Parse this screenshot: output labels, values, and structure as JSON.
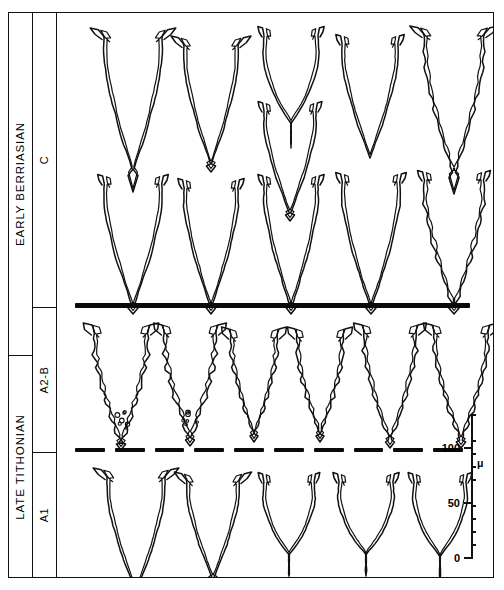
{
  "plate": {
    "title": "Calpionellid test outline drawings biostratigraphic plate",
    "background": "#ffffff",
    "ink": "#111111"
  },
  "stages": [
    {
      "id": "early-berriasian",
      "label": "EARLY BERRIASIAN",
      "top": 12,
      "height": 343
    },
    {
      "id": "late-tithonian",
      "label": "LATE TITHONIAN",
      "top": 355,
      "height": 223
    }
  ],
  "zones": [
    {
      "id": "c",
      "label": "C",
      "top": 12,
      "height": 295
    },
    {
      "id": "a2-b",
      "label": "A2-B",
      "top": 307,
      "height": 145
    },
    {
      "id": "a1",
      "label": "A1",
      "top": 452,
      "height": 126
    }
  ],
  "boundaries": [
    {
      "id": "solid-boundary",
      "style": "solid",
      "x": 75,
      "y": 303,
      "width": 395,
      "note": "Tithonian-Berriasian boundary"
    },
    {
      "id": "dashed-boundary",
      "style": "dashed",
      "x": 75,
      "y": 448,
      "width": 388,
      "dashes": 10,
      "note": "A1 / A2-B subzone boundary"
    }
  ],
  "scale": {
    "id": "micron-scale",
    "unit_label": "μ",
    "axis_x": 471,
    "axis_top": 415,
    "axis_bottom": 558,
    "min": 0,
    "max": 110,
    "minor_step": 10,
    "major_ticks": [
      {
        "value": 100,
        "label": "100",
        "y": 448
      },
      {
        "value": 50,
        "label": "50",
        "y": 503
      },
      {
        "value": 0,
        "label": "0",
        "y": 558
      }
    ],
    "minor_ticks": [
      110,
      90,
      80,
      70,
      60,
      40,
      30,
      20,
      10
    ]
  },
  "rows": [
    {
      "id": "row-c-upper",
      "zone": "C",
      "specimen_count": 5,
      "specimens": [
        {
          "id": "c-u-1",
          "cx": 45,
          "cy": 22,
          "w": 62,
          "h": 132,
          "shape": "flared-collar-pointed",
          "ornament": "smooth",
          "tail": "long-spine"
        },
        {
          "id": "c-u-2",
          "cx": 125,
          "cy": 30,
          "w": 58,
          "h": 118,
          "shape": "flared-collar-pointed",
          "ornament": "smooth",
          "tail": "short-spine"
        },
        {
          "id": "c-u-3",
          "cx": 205,
          "cy": 20,
          "w": 58,
          "h": 110,
          "shape": "collar-rounded",
          "ornament": "smooth",
          "tail": "none"
        },
        {
          "id": "c-u-4",
          "cx": 283,
          "cy": 28,
          "w": 60,
          "h": 112,
          "shape": "collar-pointed",
          "ornament": "smooth",
          "tail": "none"
        },
        {
          "id": "c-u-5",
          "cx": 365,
          "cy": 20,
          "w": 64,
          "h": 136,
          "shape": "flared-collar-pointed",
          "ornament": "crenulate",
          "tail": "long-spine"
        }
      ]
    },
    {
      "id": "row-c-mid",
      "zone": "C",
      "specimen_count": 1,
      "specimens": [
        {
          "id": "c-m-1",
          "cx": 205,
          "cy": 95,
          "w": 56,
          "h": 102,
          "shape": "collar-pointed",
          "ornament": "smooth",
          "tail": "short-spine"
        }
      ]
    },
    {
      "id": "row-c-lower",
      "zone": "C",
      "specimen_count": 5,
      "specimens": [
        {
          "id": "c-l-1",
          "cx": 45,
          "cy": 168,
          "w": 62,
          "h": 122,
          "shape": "tube-pointed",
          "ornament": "smooth",
          "tail": "short-spine"
        },
        {
          "id": "c-l-2",
          "cx": 125,
          "cy": 172,
          "w": 58,
          "h": 118,
          "shape": "tube-pointed",
          "ornament": "smooth",
          "tail": "short-spine"
        },
        {
          "id": "c-l-3",
          "cx": 205,
          "cy": 168,
          "w": 58,
          "h": 122,
          "shape": "tube-pointed",
          "ornament": "smooth",
          "tail": "short-spine"
        },
        {
          "id": "c-l-4",
          "cx": 283,
          "cy": 166,
          "w": 62,
          "h": 124,
          "shape": "tube-pointed",
          "ornament": "smooth",
          "tail": "short-spine"
        },
        {
          "id": "c-l-5",
          "cx": 365,
          "cy": 164,
          "w": 64,
          "h": 126,
          "shape": "tube-pointed",
          "ornament": "crenulate",
          "tail": "short-spine"
        }
      ]
    },
    {
      "id": "row-a2b",
      "zone": "A2-B",
      "specimen_count": 6,
      "specimens": [
        {
          "id": "a2b-1",
          "cx": 35,
          "cy": 318,
          "w": 58,
          "h": 108,
          "shape": "hook-collar-pointed",
          "ornament": "crenulate-granular",
          "tail": "short-spine"
        },
        {
          "id": "a2b-2",
          "cx": 105,
          "cy": 318,
          "w": 56,
          "h": 104,
          "shape": "hook-collar-pointed",
          "ornament": "crenulate-granular",
          "tail": "short-spine"
        },
        {
          "id": "a2b-3",
          "cx": 172,
          "cy": 322,
          "w": 50,
          "h": 96,
          "shape": "hook-collar-pointed",
          "ornament": "crenulate",
          "tail": "short-spine"
        },
        {
          "id": "a2b-4",
          "cx": 238,
          "cy": 322,
          "w": 50,
          "h": 96,
          "shape": "hook-collar-pointed",
          "ornament": "crenulate",
          "tail": "short-spine"
        },
        {
          "id": "a2b-5",
          "cx": 305,
          "cy": 318,
          "w": 56,
          "h": 106,
          "shape": "hook-collar-pointed",
          "ornament": "crenulate",
          "tail": "short-spine"
        },
        {
          "id": "a2b-6",
          "cx": 375,
          "cy": 318,
          "w": 58,
          "h": 106,
          "shape": "hook-collar-pointed",
          "ornament": "crenulate",
          "tail": "short-spine"
        }
      ]
    },
    {
      "id": "row-a1",
      "zone": "A1",
      "specimen_count": 5,
      "specimens": [
        {
          "id": "a1-1",
          "cx": 48,
          "cy": 462,
          "w": 62,
          "h": 112,
          "shape": "flared-collar-pointed",
          "ornament": "smooth",
          "tail": "long-spine"
        },
        {
          "id": "a1-2",
          "cx": 128,
          "cy": 466,
          "w": 56,
          "h": 96,
          "shape": "flared-collar-pointed",
          "ornament": "smooth",
          "tail": "short-spine"
        },
        {
          "id": "a1-3",
          "cx": 205,
          "cy": 466,
          "w": 54,
          "h": 92,
          "shape": "collar-rounded",
          "ornament": "smooth",
          "tail": "none"
        },
        {
          "id": "a1-4",
          "cx": 280,
          "cy": 466,
          "w": 58,
          "h": 92,
          "shape": "collar-rounded",
          "ornament": "smooth",
          "tail": "none"
        },
        {
          "id": "a1-5",
          "cx": 355,
          "cy": 466,
          "w": 56,
          "h": 94,
          "shape": "collar-rounded",
          "ornament": "smooth",
          "tail": "none"
        }
      ]
    }
  ]
}
